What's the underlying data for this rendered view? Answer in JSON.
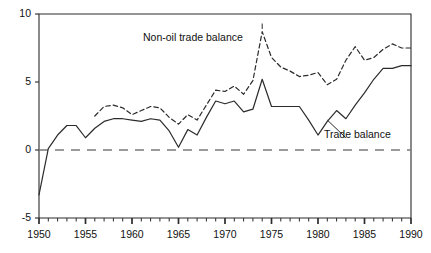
{
  "chart_data": {
    "type": "line",
    "title": "",
    "subtitle": "",
    "xlabel": "",
    "ylabel": "",
    "xlim": [
      1950,
      1990
    ],
    "ylim": [
      -5,
      10
    ],
    "grid": false,
    "legend_position": "inline-annotations",
    "y_ticks": [
      10,
      5,
      0,
      -5
    ],
    "y_tick_labels": [
      "10",
      "5",
      "0",
      "-5"
    ],
    "x_ticks": [
      1950,
      1955,
      1960,
      1965,
      1970,
      1975,
      1980,
      1985,
      1990
    ],
    "x_tick_labels": [
      "1950",
      "1955",
      "1960",
      "1965",
      "1970",
      "1975",
      "1980",
      "1985",
      "1990"
    ],
    "x_minor_tick_interval": 1,
    "zero_line": {
      "value": 0,
      "style": "dashed",
      "color": "#7a7a7a"
    },
    "axis_color": "#2b2b2b",
    "series": [
      {
        "name": "Non-oil trade balance",
        "style": "dashed",
        "color": "#2b2b2b",
        "label_text": "Non-oil trade balance",
        "x": [
          1956,
          1957,
          1958,
          1959,
          1960,
          1961,
          1962,
          1963,
          1964,
          1965,
          1966,
          1967,
          1968,
          1969,
          1970,
          1971,
          1972,
          1973,
          1974,
          1975,
          1976,
          1977,
          1978,
          1979,
          1980,
          1981,
          1982,
          1983,
          1984,
          1985,
          1986,
          1987,
          1988,
          1989,
          1990
        ],
        "values": [
          2.5,
          3.2,
          3.3,
          3.1,
          2.6,
          2.9,
          3.2,
          3.1,
          2.4,
          1.9,
          2.6,
          2.2,
          3.3,
          4.4,
          4.3,
          4.7,
          4.1,
          5.1,
          8.7,
          6.8,
          6.1,
          5.8,
          5.4,
          5.5,
          5.7,
          4.8,
          5.2,
          6.6,
          7.6,
          6.6,
          6.8,
          7.4,
          7.8,
          7.5,
          7.5
        ]
      },
      {
        "name": "Trade balance",
        "style": "solid",
        "color": "#2b2b2b",
        "label_text": "Trade balance",
        "x": [
          1950,
          1951,
          1952,
          1953,
          1954,
          1955,
          1956,
          1957,
          1958,
          1959,
          1960,
          1961,
          1962,
          1963,
          1964,
          1965,
          1966,
          1967,
          1968,
          1969,
          1970,
          1971,
          1972,
          1973,
          1974,
          1975,
          1976,
          1977,
          1978,
          1979,
          1980,
          1981,
          1982,
          1983,
          1984,
          1985,
          1986,
          1987,
          1988,
          1989,
          1990
        ],
        "values": [
          -3.3,
          0.1,
          1.1,
          1.8,
          1.8,
          0.9,
          1.6,
          2.1,
          2.3,
          2.3,
          2.2,
          2.1,
          2.3,
          2.2,
          1.4,
          0.2,
          1.5,
          1.1,
          2.4,
          3.6,
          3.4,
          3.6,
          2.8,
          3.0,
          5.2,
          3.2,
          3.2,
          3.2,
          3.2,
          2.2,
          1.1,
          2.1,
          2.9,
          2.3,
          3.3,
          4.2,
          5.2,
          6.0,
          6.0,
          6.2,
          6.2
        ]
      }
    ],
    "annotations": [
      {
        "name": "non-oil-pointer",
        "text": "",
        "from": [
          1974,
          9.3
        ],
        "to": [
          1974,
          8.9
        ]
      },
      {
        "name": "trade-pointer",
        "text": "",
        "from": [
          1981,
          2.2
        ],
        "to": [
          1983,
          0.9
        ]
      }
    ]
  }
}
